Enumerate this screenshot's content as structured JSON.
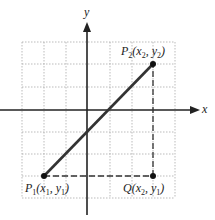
{
  "diagram": {
    "title": "",
    "axes": {
      "x_label": "x",
      "y_label": "y"
    },
    "grid": {
      "columns": 7,
      "rows": 7,
      "style": "dotted",
      "color": "#aaaaaa"
    },
    "points": [
      {
        "id": "P1",
        "name": "P",
        "sub": "1",
        "coords": "(x1, y1)",
        "x_text": "x",
        "x_sub": "1",
        "y_text": "y",
        "y_sub": "1"
      },
      {
        "id": "P2",
        "name": "P",
        "sub": "2",
        "coords": "(x2, y2)",
        "x_text": "x",
        "x_sub": "2",
        "y_text": "y",
        "y_sub": "2"
      },
      {
        "id": "Q",
        "name": "Q",
        "sub": "",
        "coords": "(x2, y1)",
        "x_text": "x",
        "x_sub": "2",
        "y_text": "y",
        "y_sub": "1"
      }
    ],
    "segments": [
      {
        "from": "P1",
        "to": "P2",
        "style": "solid"
      },
      {
        "from": "P1",
        "to": "Q",
        "style": "dashed"
      },
      {
        "from": "Q",
        "to": "P2",
        "style": "dashed"
      }
    ],
    "colors": {
      "line": "#333333",
      "grid": "#aaaaaa",
      "point": "#111111"
    }
  }
}
